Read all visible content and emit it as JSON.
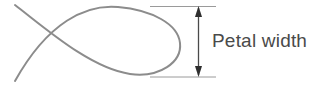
{
  "figure": {
    "type": "geometry-diagram",
    "background_color": "#ffffff",
    "label": {
      "text": "Petal width",
      "color": "#4a4a4a",
      "font_size_px": 19
    },
    "shape": {
      "name": "petal-loop-curve",
      "description": "Self-crossing petal shaped loop with two tails extending to the lower left and upper left",
      "stroke_color": "#8c8c8c",
      "stroke_width_px": 2,
      "crossing_point": {
        "x": 52,
        "y": 44
      },
      "rightmost_x": 180,
      "top_y": 6,
      "bottom_y": 77,
      "tail_upper_end": {
        "x": 15,
        "y": 5
      },
      "tail_lower_end": {
        "x": 15,
        "y": 81
      }
    },
    "dimension": {
      "name": "petal-width-measure",
      "orientation": "vertical",
      "arrow_x": 198,
      "arrow_top_y": 6,
      "arrow_bottom_y": 77,
      "arrow_color": "#3a3a3a",
      "arrowheads": "both-ends",
      "guide_lines": {
        "color": "#9a9a9a",
        "top_y": 6,
        "bottom_y": 77,
        "x_start": 150,
        "x_end": 216
      }
    }
  }
}
